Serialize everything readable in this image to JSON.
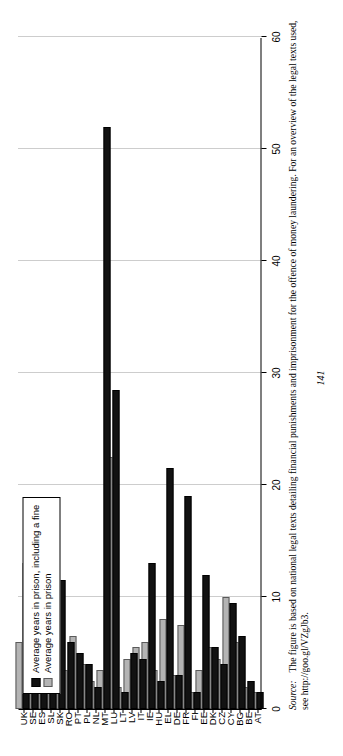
{
  "page": {
    "folio": "141"
  },
  "legend": {
    "position": "top-left-inside",
    "items": [
      {
        "label": "Average years in prison, including a fine",
        "color": "#121212",
        "key": "fine"
      },
      {
        "label": "Average years in prison",
        "color": "#b4b4b4",
        "key": "prison"
      }
    ]
  },
  "source": {
    "lead": "Source:",
    "text": "The figure is based on national legal texts detailing financial punishments and imprisonment for the offence of money laundering. For an overview of the legal texts used, see http://goo.gl/VZgJb3."
  },
  "chart_data": {
    "type": "bar",
    "orientation": "horizontal",
    "title": "",
    "xlabel": "",
    "ylabel": "",
    "xlim": [
      0,
      60
    ],
    "ticks": [
      0,
      10,
      20,
      30,
      40,
      50,
      60
    ],
    "tick_labels": [
      "0",
      "10",
      "20",
      "30",
      "40",
      "50",
      "60"
    ],
    "grid": "dotted-vertical",
    "categories": [
      "AT",
      "BE",
      "BG",
      "CY",
      "CZ",
      "DK",
      "EE",
      "FI",
      "FR",
      "DE",
      "EL",
      "HU",
      "IE",
      "IT",
      "LV",
      "LT",
      "LU",
      "MT",
      "NL",
      "PL",
      "PT",
      "RO",
      "SK",
      "SL",
      "ES",
      "SE",
      "UK"
    ],
    "series": [
      {
        "name": "Average years in prison, including a fine",
        "color": "#121212",
        "values": [
          1.5,
          2.5,
          6.5,
          9.5,
          4.0,
          5.5,
          12.0,
          1.5,
          19.0,
          3.0,
          21.5,
          2.5,
          13.0,
          4.5,
          5.0,
          1.5,
          28.5,
          52.0,
          2.0,
          4.0,
          5.0,
          6.0,
          11.5,
          10.5,
          11.0,
          2.0,
          13.0
        ]
      },
      {
        "name": "Average years in prison",
        "color": "#b4b4b4",
        "values": [
          1.5,
          2.0,
          6.0,
          10.0,
          4.5,
          5.5,
          3.5,
          1.5,
          7.5,
          3.0,
          8.0,
          3.5,
          6.0,
          5.5,
          4.5,
          2.0,
          22.5,
          3.5,
          2.5,
          4.0,
          6.5,
          3.5,
          11.5,
          7.5,
          4.5,
          1.5,
          6.0
        ]
      }
    ]
  }
}
